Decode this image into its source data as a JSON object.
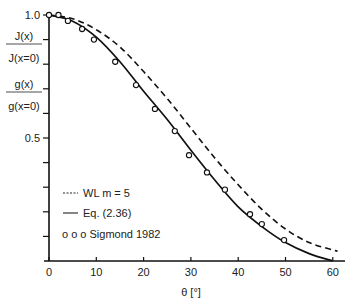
{
  "chart_data": {
    "type": "line",
    "title": "",
    "xlabel": "θ [°]",
    "ylabel_lines": [
      {
        "num": "J(x)",
        "den": "J(x=0)"
      },
      {
        "num": "g(x)",
        "den": "g(x=0)"
      }
    ],
    "xlim": [
      0,
      63
    ],
    "ylim": [
      0,
      1.0
    ],
    "x_ticks": [
      0,
      10,
      20,
      30,
      40,
      50,
      60
    ],
    "y_tick_labels": [
      {
        "value": 1.0,
        "label": "1.0"
      },
      {
        "value": 0.5,
        "label": "0.5"
      }
    ],
    "y_minor_ticks": [
      0.1,
      0.2,
      0.3,
      0.4,
      0.6,
      0.7,
      0.8,
      0.9
    ],
    "grid": false,
    "legend_position": "lower-left inside plot",
    "series": [
      {
        "name": "WL m = 5",
        "style": "dashed",
        "x": [
          0,
          5,
          10,
          15,
          20,
          25,
          30,
          35,
          40,
          45,
          50,
          55,
          60,
          61
        ],
        "y": [
          1.0,
          0.985,
          0.94,
          0.87,
          0.77,
          0.66,
          0.54,
          0.42,
          0.31,
          0.21,
          0.13,
          0.075,
          0.045,
          0.04
        ]
      },
      {
        "name": "Eq. (2.36)",
        "style": "solid",
        "x": [
          0,
          5,
          10,
          15,
          20,
          25,
          30,
          35,
          40,
          45,
          50,
          55,
          60
        ],
        "y": [
          1.0,
          0.975,
          0.91,
          0.81,
          0.69,
          0.575,
          0.45,
          0.33,
          0.22,
          0.14,
          0.075,
          0.03,
          0.0
        ]
      },
      {
        "name": "Sigmond 1982",
        "style": "markers",
        "x": [
          0,
          2,
          4,
          7,
          9.5,
          14,
          18.4,
          22.4,
          26.6,
          29.6,
          33.4,
          37.2,
          42.5,
          45,
          49.7
        ],
        "y": [
          1.0,
          1.0,
          0.976,
          0.943,
          0.9,
          0.81,
          0.715,
          0.618,
          0.528,
          0.43,
          0.36,
          0.29,
          0.19,
          0.15,
          0.085
        ]
      }
    ],
    "legend": [
      {
        "symbol": "-----",
        "label": "WL m = 5"
      },
      {
        "symbol": "——",
        "label": "Eq. (2.36)"
      },
      {
        "symbol": "o o o",
        "label": "Sigmond 1982"
      }
    ]
  }
}
